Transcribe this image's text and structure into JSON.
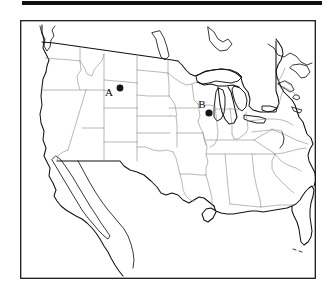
{
  "page": {
    "background_color": "#ffffff",
    "top_rule": {
      "color": "#111111",
      "label": "page-top-rule"
    }
  },
  "figure": {
    "kind": "map",
    "title": "",
    "caption": "",
    "region": "Contiguous United States",
    "frame_color": "#1a1a1a",
    "coastline_color": "#111111",
    "state_border_color": "#8d8d8d",
    "water_fill": "#ffffff",
    "land_fill": "#ffffff"
  },
  "markers": [
    {
      "id": "A",
      "label": "A",
      "label_x": 89,
      "label_y": 76,
      "dot_x": 100,
      "dot_y": 68,
      "dot_radius": 3.4,
      "color": "#151515",
      "approx_location": "Montana"
    },
    {
      "id": "B",
      "label": "B",
      "label_x": 182,
      "label_y": 88,
      "dot_x": 189,
      "dot_y": 93,
      "dot_radius": 3.6,
      "color": "#151515",
      "approx_location": "Wisconsin"
    }
  ],
  "legend": {
    "visible": false,
    "entries": []
  },
  "axes": {
    "visible": false,
    "x_ticks": [],
    "y_ticks": []
  }
}
